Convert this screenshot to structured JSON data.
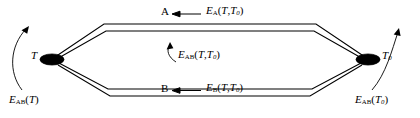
{
  "figure": {
    "type": "thermocouple-circuit-diagram",
    "background": "#ffffff",
    "stroke_color": "#000000",
    "width": 420,
    "height": 118
  },
  "nodes": {
    "left": {
      "label_main": "T",
      "label_sub": "",
      "marker": "filled-ellipse",
      "x": 52,
      "y": 59
    },
    "right": {
      "label_main": "T",
      "label_sub": "0",
      "marker": "filled-ellipse",
      "x": 368,
      "y": 59
    }
  },
  "branches": {
    "upper": {
      "conductor_label": "A",
      "emf_main": "E",
      "emf_sub": "A",
      "emf_args_open": "(",
      "emf_arg1": "T",
      "emf_comma": ",",
      "emf_arg2": "T",
      "emf_arg2_sub": "0",
      "emf_args_close": ")",
      "arrow_direction": "left"
    },
    "lower": {
      "conductor_label": "B",
      "emf_main": "E",
      "emf_sub": "B",
      "emf_args_open": "(",
      "emf_arg1": "T",
      "emf_comma": ",",
      "emf_arg2": "T",
      "emf_arg2_sub": "0",
      "emf_args_close": ")",
      "arrow_direction": "left"
    }
  },
  "emf_labels": {
    "center": {
      "main": "E",
      "sub": "AB",
      "open": "(",
      "arg1": "T",
      "comma": ",",
      "arg2": "T",
      "arg2_sub": "0",
      "close": ")",
      "arc_arrow": "counterclockwise"
    },
    "left": {
      "main": "E",
      "sub": "AB",
      "open": "(",
      "arg1": "T",
      "close": ")",
      "arc_arrow": "counterclockwise"
    },
    "right": {
      "main": "E",
      "sub": "AB",
      "open": "(",
      "arg1": "T",
      "arg1_sub": "0",
      "close": ")",
      "arc_arrow": "counterclockwise"
    }
  }
}
